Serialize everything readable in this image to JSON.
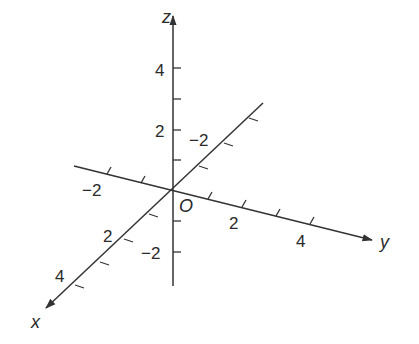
{
  "diagram": {
    "origin_label": "O",
    "colors": {
      "line": "#333333",
      "text": "#2a2a2a",
      "background": "#ffffff"
    },
    "axes": {
      "x": {
        "label": "x",
        "tick_labels": [
          "−2",
          "2",
          "4"
        ],
        "range": [
          -3,
          4
        ]
      },
      "y": {
        "label": "y",
        "tick_labels": [
          "−2",
          "2",
          "4"
        ],
        "range": [
          -3,
          4
        ]
      },
      "z": {
        "label": "z",
        "tick_labels": [
          "4",
          "2",
          "−2"
        ],
        "range": [
          -3,
          5
        ]
      }
    }
  }
}
